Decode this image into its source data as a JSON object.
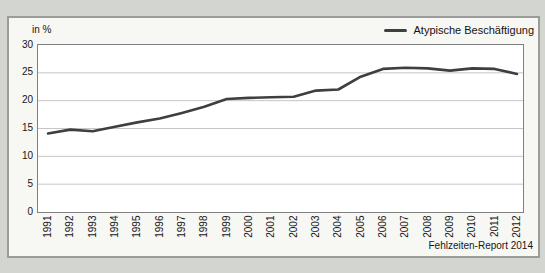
{
  "colors": {
    "paper": "#d3d5d0",
    "frame_bg": "#f7f7f4",
    "frame_border": "#9b9b99",
    "plot_bg": "#ffffff",
    "plot_border": "#808080",
    "gridline": "#c6c6c6",
    "series_line": "#3f3f3f",
    "text": "#161616"
  },
  "chart_data": {
    "type": "line",
    "title": "",
    "ylabel": "in %",
    "xlabel": "",
    "x": [
      "1991",
      "1992",
      "1993",
      "1994",
      "1995",
      "1996",
      "1997",
      "1998",
      "1999",
      "2000",
      "2001",
      "2002",
      "2003",
      "2004",
      "2005",
      "2006",
      "2007",
      "2008",
      "2009",
      "2010",
      "2011",
      "2012"
    ],
    "series": [
      {
        "name": "Atypische Beschäftigung",
        "color": "#3f3f3f",
        "values": [
          14.1,
          14.8,
          14.5,
          15.3,
          16.1,
          16.8,
          17.8,
          18.9,
          20.3,
          20.5,
          20.6,
          20.7,
          21.8,
          22.0,
          24.3,
          25.7,
          25.9,
          25.8,
          25.4,
          25.8,
          25.7,
          24.8
        ]
      }
    ],
    "ylim": [
      0,
      30
    ],
    "yticks": [
      0,
      5,
      10,
      15,
      20,
      25,
      30
    ],
    "grid": true,
    "legend_position": "top-right",
    "source": "Fehlzeiten-Report 2014"
  }
}
